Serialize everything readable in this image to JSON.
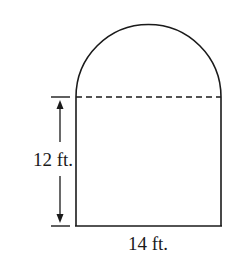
{
  "diagram": {
    "type": "composite-shape",
    "shapes": [
      {
        "name": "rectangle",
        "height_label": "12 ft.",
        "width_label": "14 ft."
      },
      {
        "name": "semicircle",
        "diameter": "14 ft."
      }
    ],
    "labels": {
      "height": "12 ft.",
      "width": "14 ft."
    },
    "colors": {
      "stroke": "#1a1a1a",
      "background": "#ffffff"
    }
  }
}
